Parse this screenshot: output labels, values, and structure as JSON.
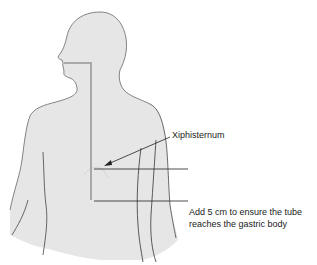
{
  "diagram": {
    "colors": {
      "body_fill": "#e6e6e6",
      "body_outline": "#555555",
      "tube": "#a8a8a8",
      "lines": "#222222",
      "text": "#1a1a1a"
    },
    "labels": {
      "xiphisternum": "Xiphisternum",
      "note_line1": "Add 5 cm to ensure the tube",
      "note_line2": "reaches the gastric body"
    }
  }
}
